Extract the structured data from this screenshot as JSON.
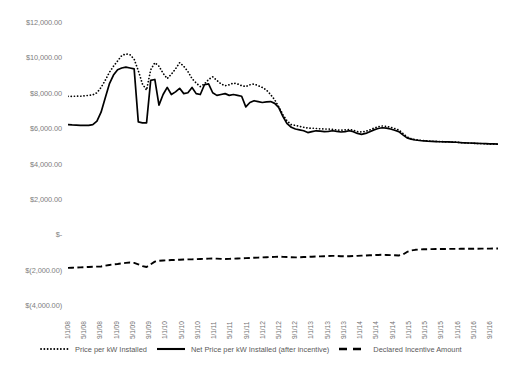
{
  "chart_data": {
    "type": "line",
    "title": "",
    "xlabel": "",
    "ylabel": "",
    "ylim": [
      -4000,
      12000
    ],
    "ytick_step": 2000,
    "grid": false,
    "legend_position": "bottom",
    "y_tick_labels": [
      "$12,000.00",
      "$10,000.00",
      "$8,000.00",
      "$6,000.00",
      "$4,000.00",
      "$2,000.00",
      "$-",
      "$(2,000.00)",
      "$(4,000.00)"
    ],
    "y_tick_values": [
      12000,
      10000,
      8000,
      6000,
      4000,
      2000,
      0,
      -2000,
      -4000
    ],
    "x_tick_labels": [
      "1/1/08",
      "5/1/08",
      "9/1/08",
      "1/1/09",
      "5/1/09",
      "9/1/09",
      "1/1/10",
      "5/1/10",
      "9/1/10",
      "1/1/11",
      "5/1/11",
      "9/1/11",
      "1/1/12",
      "5/1/12",
      "9/1/12",
      "1/1/13",
      "5/1/13",
      "9/1/13",
      "1/1/14",
      "5/1/14",
      "9/1/14",
      "1/1/15",
      "5/1/15",
      "9/1/15",
      "1/1/16",
      "5/1/16",
      "9/1/16"
    ],
    "series": [
      {
        "name": "Price per kW Installed",
        "style": "dotted",
        "color": "#000000",
        "values": [
          7800,
          7790,
          7810,
          7800,
          7830,
          7850,
          7880,
          8000,
          8300,
          8700,
          9150,
          9500,
          9800,
          10100,
          10200,
          10150,
          9900,
          9250,
          8500,
          8150,
          9300,
          9700,
          9500,
          9100,
          8800,
          9050,
          9350,
          9700,
          9500,
          9200,
          8800,
          8550,
          8350,
          8500,
          8750,
          8900,
          8700,
          8500,
          8400,
          8450,
          8550,
          8500,
          8400,
          8350,
          8450,
          8500,
          8400,
          8300,
          8150,
          7900,
          7600,
          7200,
          6750,
          6400,
          6200,
          6150,
          6100,
          6050,
          6000,
          6000,
          5980,
          5960,
          5950,
          5950,
          5930,
          5900,
          5880,
          5900,
          5920,
          5880,
          5800,
          5780,
          5820,
          5900,
          6000,
          6080,
          6120,
          6100,
          6050,
          5980,
          5900,
          5700,
          5500,
          5400,
          5350,
          5320,
          5300,
          5280,
          5260,
          5250,
          5240,
          5230,
          5220,
          5210,
          5200,
          5180,
          5170,
          5150,
          5140,
          5130,
          5120,
          5110,
          5100,
          5100,
          5090
        ]
      },
      {
        "name": "Net Price per kW Installed (after incentive)",
        "style": "solid",
        "color": "#000000",
        "values": [
          6200,
          6180,
          6170,
          6160,
          6150,
          6160,
          6200,
          6400,
          6900,
          7700,
          8500,
          9000,
          9300,
          9400,
          9450,
          9400,
          9350,
          6350,
          6300,
          6300,
          8700,
          8750,
          7300,
          7900,
          8300,
          7900,
          8050,
          8250,
          7950,
          8000,
          8300,
          7950,
          7900,
          8450,
          8500,
          8000,
          7850,
          7900,
          7950,
          7850,
          7900,
          7850,
          7800,
          7200,
          7450,
          7550,
          7500,
          7450,
          7480,
          7500,
          7400,
          7150,
          6650,
          6250,
          6050,
          5950,
          5900,
          5850,
          5750,
          5800,
          5850,
          5830,
          5800,
          5820,
          5850,
          5820,
          5780,
          5800,
          5850,
          5800,
          5700,
          5650,
          5700,
          5800,
          5900,
          5980,
          6020,
          6000,
          5950,
          5880,
          5800,
          5620,
          5450,
          5380,
          5330,
          5300,
          5280,
          5260,
          5250,
          5240,
          5230,
          5220,
          5220,
          5210,
          5200,
          5180,
          5170,
          5160,
          5150,
          5140,
          5130,
          5120,
          5110,
          5110,
          5100
        ]
      },
      {
        "name": "Declared Incentive Amount",
        "style": "dashed",
        "color": "#000000",
        "values": [
          -1900,
          -1890,
          -1880,
          -1870,
          -1860,
          -1850,
          -1840,
          -1830,
          -1820,
          -1780,
          -1740,
          -1700,
          -1680,
          -1650,
          -1620,
          -1600,
          -1620,
          -1700,
          -1800,
          -1850,
          -1700,
          -1550,
          -1500,
          -1480,
          -1470,
          -1460,
          -1450,
          -1440,
          -1430,
          -1420,
          -1420,
          -1410,
          -1400,
          -1390,
          -1380,
          -1370,
          -1380,
          -1390,
          -1400,
          -1390,
          -1380,
          -1370,
          -1360,
          -1350,
          -1340,
          -1330,
          -1320,
          -1310,
          -1300,
          -1290,
          -1280,
          -1270,
          -1280,
          -1290,
          -1300,
          -1310,
          -1300,
          -1290,
          -1280,
          -1270,
          -1260,
          -1250,
          -1240,
          -1230,
          -1220,
          -1230,
          -1240,
          -1250,
          -1240,
          -1230,
          -1220,
          -1210,
          -1200,
          -1190,
          -1180,
          -1170,
          -1160,
          -1170,
          -1180,
          -1190,
          -1200,
          -1150,
          -1000,
          -920,
          -880,
          -860,
          -850,
          -845,
          -840,
          -838,
          -835,
          -833,
          -830,
          -828,
          -826,
          -824,
          -822,
          -820,
          -818,
          -816,
          -814,
          -812,
          -810,
          -808,
          -806
        ]
      }
    ]
  },
  "legend": {
    "items": [
      {
        "label": "Price per kW Installed",
        "style": "dotted"
      },
      {
        "label": "Net Price per kW Installed (after incentive)",
        "style": "solid"
      },
      {
        "label": "Declared Incentive Amount",
        "style": "dashed"
      }
    ]
  }
}
